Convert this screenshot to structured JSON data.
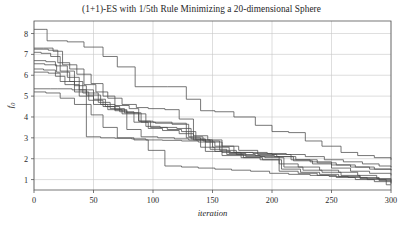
{
  "chart_data": {
    "type": "line",
    "title": "(1+1)-ES with 1/5th Rule Minimizing a 20-dimensional Sphere",
    "xlabel": "iteration",
    "ylabel": "f",
    "ylabel_subscript": "0",
    "xlim": [
      0,
      300
    ],
    "ylim": [
      0.5,
      8.6
    ],
    "xticks": [
      0,
      50,
      100,
      150,
      200,
      250,
      300
    ],
    "xtick_labels": [
      "0",
      "50",
      "100",
      "150",
      "200",
      "250",
      "300"
    ],
    "yticks": [
      1,
      2,
      3,
      4,
      5,
      6,
      7,
      8
    ],
    "ytick_labels": [
      "1",
      "2",
      "3",
      "4",
      "5",
      "6",
      "7",
      "8"
    ],
    "grid": true,
    "grid_color": "#c8c8c8",
    "line_color": "#4a4a4a",
    "legend": "none",
    "step_style": "post",
    "series": [
      {
        "name": "run-1",
        "x": [
          0,
          10,
          11,
          28,
          42,
          58,
          70,
          85,
          100,
          112,
          128,
          140,
          152,
          168,
          186,
          200,
          214,
          228,
          242,
          258,
          272,
          286,
          300
        ],
        "values": [
          8.2,
          8.2,
          7.65,
          7.6,
          7.35,
          6.9,
          6.4,
          5.45,
          5.45,
          5.45,
          4.85,
          4.3,
          4.25,
          4.0,
          3.6,
          3.3,
          3.25,
          2.85,
          2.6,
          2.3,
          2.15,
          2.05,
          1.95
        ]
      },
      {
        "name": "run-2",
        "x": [
          0,
          8,
          16,
          24,
          36,
          48,
          58,
          68,
          80,
          88,
          100,
          116,
          128,
          140,
          152,
          165,
          180,
          196,
          212,
          228,
          244,
          260,
          276,
          290,
          300
        ],
        "values": [
          7.3,
          7.3,
          7.15,
          6.5,
          6.05,
          5.6,
          5.0,
          4.55,
          4.4,
          3.8,
          3.75,
          3.7,
          3.0,
          2.55,
          2.35,
          2.3,
          2.3,
          2.25,
          2.2,
          2.1,
          1.95,
          1.85,
          1.75,
          1.65,
          1.6
        ]
      },
      {
        "name": "run-3",
        "x": [
          0,
          12,
          20,
          30,
          42,
          52,
          62,
          74,
          86,
          96,
          110,
          122,
          134,
          146,
          158,
          172,
          188,
          204,
          220,
          238,
          254,
          270,
          286,
          300
        ],
        "values": [
          7.25,
          7.2,
          6.6,
          6.3,
          5.55,
          5.2,
          4.9,
          4.6,
          4.45,
          4.4,
          4.35,
          3.9,
          3.1,
          2.9,
          2.6,
          2.4,
          2.2,
          2.1,
          1.95,
          1.8,
          1.7,
          1.6,
          1.5,
          1.45
        ]
      },
      {
        "name": "run-4",
        "x": [
          0,
          6,
          14,
          22,
          34,
          44,
          56,
          68,
          78,
          90,
          102,
          116,
          130,
          142,
          156,
          170,
          186,
          202,
          218,
          234,
          250,
          266,
          282,
          300
        ],
        "values": [
          7.1,
          7.05,
          6.9,
          6.2,
          5.5,
          5.05,
          4.6,
          4.35,
          4.2,
          3.75,
          3.7,
          3.65,
          3.05,
          2.85,
          2.4,
          2.2,
          2.15,
          2.1,
          1.9,
          1.75,
          1.55,
          1.4,
          1.3,
          1.2
        ]
      },
      {
        "name": "run-5",
        "x": [
          0,
          10,
          18,
          28,
          38,
          50,
          60,
          72,
          84,
          94,
          106,
          120,
          132,
          144,
          158,
          174,
          190,
          206,
          222,
          240,
          256,
          272,
          288,
          300
        ],
        "values": [
          6.7,
          6.65,
          6.45,
          5.9,
          5.3,
          4.85,
          4.5,
          4.25,
          4.15,
          3.55,
          3.5,
          3.45,
          2.95,
          2.8,
          2.3,
          2.15,
          2.1,
          1.75,
          1.6,
          1.45,
          1.35,
          1.2,
          1.05,
          0.95
        ]
      },
      {
        "name": "run-6",
        "x": [
          0,
          9,
          19,
          30,
          41,
          54,
          64,
          76,
          88,
          98,
          112,
          124,
          136,
          150,
          164,
          178,
          194,
          210,
          226,
          242,
          258,
          274,
          290,
          300
        ],
        "values": [
          6.55,
          6.5,
          6.15,
          5.7,
          5.15,
          4.7,
          4.4,
          4.2,
          3.8,
          3.5,
          3.4,
          3.3,
          2.9,
          2.55,
          2.25,
          2.1,
          2.05,
          1.6,
          1.45,
          1.35,
          1.2,
          1.1,
          1.0,
          0.9
        ]
      },
      {
        "name": "run-7",
        "x": [
          0,
          8,
          18,
          26,
          38,
          50,
          62,
          74,
          84,
          96,
          108,
          122,
          134,
          148,
          162,
          176,
          192,
          208,
          224,
          240,
          256,
          274,
          290,
          300
        ],
        "values": [
          6.3,
          6.25,
          5.95,
          5.55,
          5.0,
          4.6,
          4.35,
          4.15,
          3.75,
          3.45,
          3.35,
          3.2,
          2.9,
          2.45,
          2.2,
          2.05,
          1.95,
          1.5,
          1.35,
          1.25,
          1.15,
          1.05,
          0.95,
          0.85
        ]
      },
      {
        "name": "run-8",
        "x": [
          0,
          12,
          22,
          34,
          46,
          58,
          68,
          78,
          90,
          104,
          118,
          130,
          144,
          158,
          174,
          190,
          206,
          222,
          238,
          254,
          270,
          286,
          300
        ],
        "values": [
          6.15,
          6.1,
          5.7,
          5.2,
          4.8,
          4.5,
          4.3,
          3.4,
          3.05,
          3.0,
          2.95,
          2.9,
          2.35,
          2.15,
          2.05,
          1.95,
          1.4,
          1.3,
          1.2,
          1.1,
          1.0,
          0.9,
          0.8
        ]
      },
      {
        "name": "run-9",
        "x": [
          0,
          14,
          20,
          32,
          43,
          44,
          56,
          68,
          82,
          94,
          108,
          124,
          138,
          152,
          168,
          184,
          200,
          216,
          232,
          250,
          266,
          282,
          300
        ],
        "values": [
          5.35,
          5.35,
          5.35,
          5.3,
          5.3,
          3.05,
          3.0,
          2.98,
          2.95,
          2.9,
          2.88,
          2.85,
          2.8,
          2.6,
          2.3,
          2.25,
          2.2,
          1.95,
          1.85,
          1.7,
          1.6,
          1.5,
          1.45
        ]
      },
      {
        "name": "run-10",
        "x": [
          0,
          10,
          22,
          34,
          48,
          58,
          70,
          84,
          96,
          110,
          124,
          138,
          152,
          166,
          182,
          198,
          214,
          232,
          248,
          264,
          280,
          296,
          300
        ],
        "values": [
          5.2,
          5.15,
          4.9,
          4.6,
          4.1,
          3.5,
          3.0,
          2.9,
          2.4,
          1.65,
          1.6,
          1.55,
          1.5,
          1.45,
          1.4,
          1.3,
          1.25,
          1.2,
          1.15,
          1.1,
          1.0,
          0.75,
          0.75
        ]
      }
    ]
  },
  "plot_geometry": {
    "left": 34,
    "top": 21,
    "right": 391,
    "bottom": 190
  }
}
